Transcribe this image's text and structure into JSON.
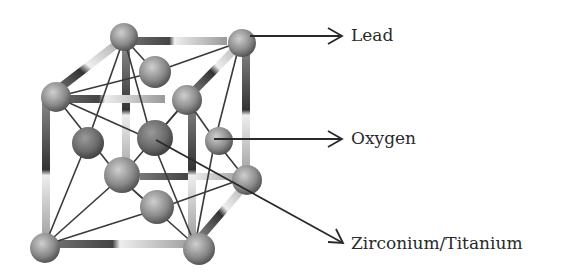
{
  "diagram": {
    "labels": {
      "lead": "Lead",
      "oxygen": "Oxygen",
      "zirconium_titanium": "Zirconium/Titanium"
    },
    "colors": {
      "background": "#ffffff",
      "line": "#333333",
      "text": "#2a2a2a",
      "atom_light": "#c8c8c8",
      "atom_dark": "#4a4a4a"
    }
  }
}
